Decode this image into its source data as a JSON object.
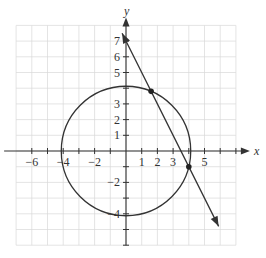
{
  "chart_data": {
    "type": "line",
    "title": "",
    "xlabel": "x",
    "ylabel": "y",
    "xlim": [
      -7,
      7
    ],
    "ylim": [
      -6,
      8
    ],
    "grid": true,
    "x_ticks": [
      -6,
      -4,
      -2,
      1,
      2,
      3,
      5
    ],
    "y_ticks": [
      7,
      6,
      5,
      3,
      2,
      1,
      -2,
      -4
    ],
    "circle": {
      "center": [
        0,
        0
      ],
      "radius": 4.123,
      "equation": "x^2 + y^2 = 17"
    },
    "line": {
      "equation": "y = -2x + 7",
      "slope": -2,
      "intercept": 7,
      "start": [
        -0.25,
        7.5
      ],
      "end": [
        5.9,
        -4.8
      ]
    },
    "points": [
      {
        "x": 1.6,
        "y": 3.8
      },
      {
        "x": 4,
        "y": -1
      }
    ],
    "colors": {
      "curve": "#333333",
      "grid": "#d8d8d8",
      "axis": "#333333"
    }
  },
  "labels": {
    "x_axis": "x",
    "y_axis": "y",
    "x_ticks": [
      "−6",
      "−4",
      "−2",
      "1",
      "2",
      "3",
      "5"
    ],
    "y_ticks": [
      "7",
      "6",
      "5",
      "3",
      "2",
      "1",
      "−2",
      "−4"
    ]
  }
}
